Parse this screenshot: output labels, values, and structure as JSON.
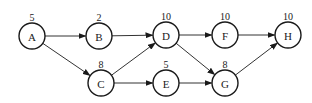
{
  "diagram": {
    "type": "activity-network",
    "nodes": [
      {
        "id": "A",
        "label": "A",
        "weight": "5"
      },
      {
        "id": "B",
        "label": "B",
        "weight": "2"
      },
      {
        "id": "C",
        "label": "C",
        "weight": "8"
      },
      {
        "id": "D",
        "label": "D",
        "weight": "10"
      },
      {
        "id": "E",
        "label": "E",
        "weight": "5"
      },
      {
        "id": "F",
        "label": "F",
        "weight": "10"
      },
      {
        "id": "G",
        "label": "G",
        "weight": "8"
      },
      {
        "id": "H",
        "label": "H",
        "weight": "10"
      }
    ],
    "edges": [
      {
        "from": "A",
        "to": "B"
      },
      {
        "from": "A",
        "to": "C"
      },
      {
        "from": "B",
        "to": "D"
      },
      {
        "from": "C",
        "to": "D"
      },
      {
        "from": "C",
        "to": "E"
      },
      {
        "from": "D",
        "to": "F"
      },
      {
        "from": "D",
        "to": "G"
      },
      {
        "from": "E",
        "to": "G"
      },
      {
        "from": "F",
        "to": "H"
      },
      {
        "from": "G",
        "to": "H"
      }
    ]
  }
}
